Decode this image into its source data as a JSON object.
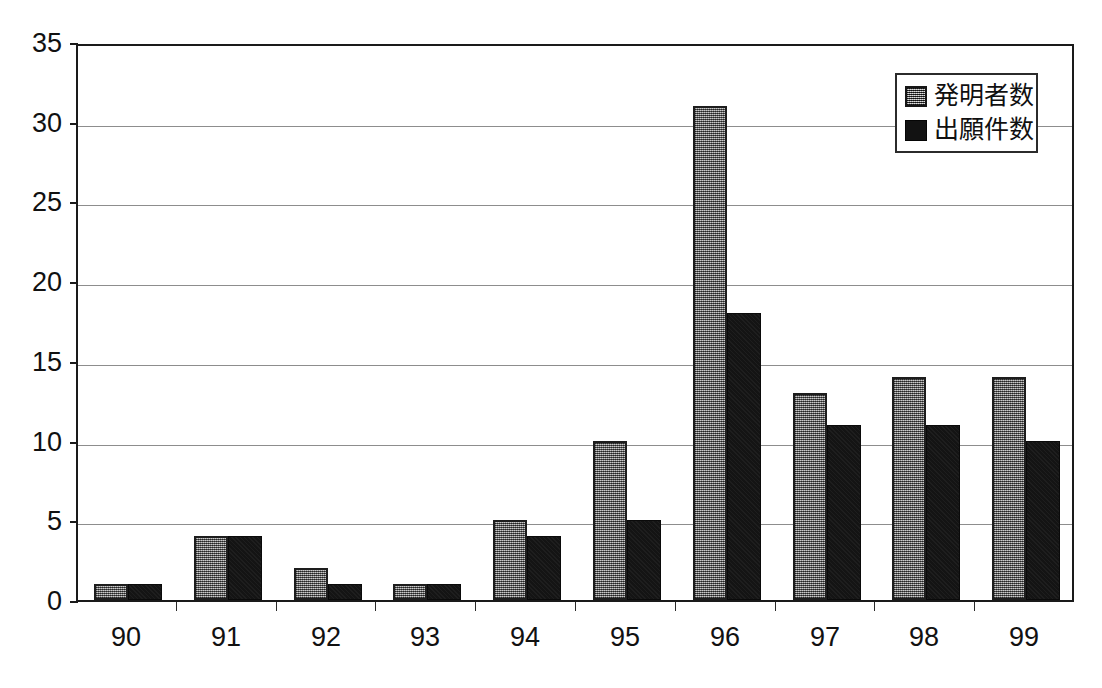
{
  "chart_data": {
    "type": "bar",
    "title": "",
    "subtitle": "",
    "xlabel": "",
    "ylabel": "",
    "categories": [
      "90",
      "91",
      "92",
      "93",
      "94",
      "95",
      "96",
      "97",
      "98",
      "99"
    ],
    "series": [
      {
        "name": "発明者数",
        "color": "#8a8a8a",
        "values": [
          1,
          4,
          2,
          1,
          5,
          10,
          31,
          13,
          14,
          14
        ]
      },
      {
        "name": "出願件数",
        "color": "#141414",
        "values": [
          1,
          4,
          1,
          1,
          4,
          5,
          18,
          11,
          11,
          10
        ]
      }
    ],
    "ylim": [
      0,
      35
    ],
    "ytick_values": [
      0,
      5,
      10,
      15,
      20,
      25,
      30,
      35
    ],
    "ytick_labels": [
      "0",
      "5",
      "10",
      "15",
      "20",
      "25",
      "30",
      "35"
    ],
    "grid": true,
    "grid_axis": "y",
    "legend_position": "top-right",
    "frame": true,
    "colors": {
      "axis": "#1a1a1a",
      "grid": "#8d8d8d",
      "background": "#ffffff",
      "text": "#111111"
    }
  }
}
